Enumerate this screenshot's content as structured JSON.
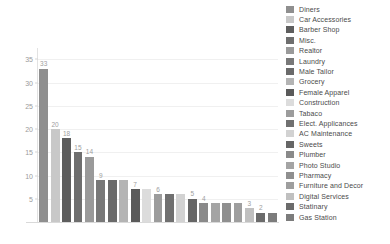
{
  "chart_data": {
    "type": "bar",
    "title": "",
    "subtitle": "",
    "xlabel": "",
    "ylabel": "",
    "ylim": [
      0,
      37
    ],
    "grid": true,
    "legend_position": "right",
    "y_ticks": [
      5,
      10,
      15,
      20,
      25,
      30,
      35
    ],
    "categories": [
      "Diners",
      "Car Accessories",
      "Barber Shop",
      "Misc.",
      "Realtor",
      "Laundry",
      "Male Tailor",
      "Grocery",
      "Female Apparel",
      "Construction",
      "Tabaco",
      "Elect. Applicances",
      "AC Maintenance",
      "Sweets",
      "Plumber",
      "Photo Studio",
      "Pharmacy",
      "Furniture and Decor",
      "Digital Services",
      "Statinary",
      "Gas Station"
    ],
    "values": [
      33,
      20,
      18,
      15,
      14,
      9,
      9,
      9,
      7,
      7,
      6,
      6,
      6,
      5,
      4,
      4,
      4,
      4,
      3,
      2,
      2
    ],
    "colors": [
      "#8f8f8f",
      "#c8c8c8",
      "#5e5e5e",
      "#6e6e6e",
      "#9a9a9a",
      "#787878",
      "#6a6a6a",
      "#b4b4b4",
      "#5a5a5a",
      "#dcdcdc",
      "#9c9c9c",
      "#707070",
      "#d2d2d2",
      "#666666",
      "#8a8a8a",
      "#a4a4a4",
      "#8f8f8f",
      "#9e9e9e",
      "#c0c0c0",
      "#6b6b6b",
      "#7c7c7c"
    ],
    "legend": [
      {
        "label": "Diners",
        "color": "#8f8f8f"
      },
      {
        "label": "Car Accessories",
        "color": "#c8c8c8"
      },
      {
        "label": "Barber Shop",
        "color": "#5e5e5e"
      },
      {
        "label": "Misc.",
        "color": "#6e6e6e"
      },
      {
        "label": "Realtor",
        "color": "#9a9a9a"
      },
      {
        "label": "Laundry",
        "color": "#787878"
      },
      {
        "label": "Male Tailor",
        "color": "#6a6a6a"
      },
      {
        "label": "Grocery",
        "color": "#b4b4b4"
      },
      {
        "label": "Female Apparel",
        "color": "#5a5a5a"
      },
      {
        "label": "Construction",
        "color": "#dcdcdc"
      },
      {
        "label": "Tabaco",
        "color": "#9c9c9c"
      },
      {
        "label": "Elect. Applicances",
        "color": "#707070"
      },
      {
        "label": "AC Maintenance",
        "color": "#d2d2d2"
      },
      {
        "label": "Sweets",
        "color": "#666666"
      },
      {
        "label": "Plumber",
        "color": "#8a8a8a"
      },
      {
        "label": "Photo Studio",
        "color": "#a4a4a4"
      },
      {
        "label": "Pharmacy",
        "color": "#8f8f8f"
      },
      {
        "label": "Furniture and Decor",
        "color": "#9e9e9e"
      },
      {
        "label": "Digital Services",
        "color": "#c0c0c0"
      },
      {
        "label": "Statinary",
        "color": "#6b6b6b"
      },
      {
        "label": "Gas Station",
        "color": "#7c7c7c"
      }
    ]
  }
}
